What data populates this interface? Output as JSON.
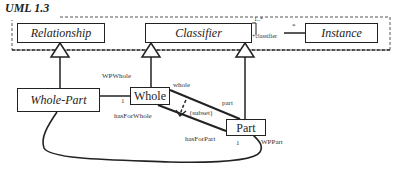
{
  "title": "UML 1.3",
  "package": {
    "classes": {
      "relationship": "Relationship",
      "classifier": "Classifier",
      "instance": "Instance"
    },
    "association": {
      "classifier_multiplicity": "1..*",
      "classifier_role": "+classifier",
      "instance_multiplicity": "*"
    }
  },
  "model": {
    "classes": {
      "whole_part": "Whole-Part",
      "whole": "Whole",
      "part": "Part"
    },
    "labels": {
      "wpwhole": "WPWhole",
      "whole_mult": "1",
      "whole_role": "whole",
      "part_role": "part",
      "subset": "{subset}",
      "has_for_whole": "hasForWhole",
      "has_for_part": "hasForPart",
      "part_mult": "1",
      "wppart": "WPPart"
    }
  }
}
